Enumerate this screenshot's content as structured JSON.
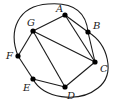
{
  "diagram": {
    "type": "graph",
    "nodes": [
      {
        "id": "A",
        "label": "A",
        "x": 65,
        "y": 15,
        "lx": 56,
        "ly": 12
      },
      {
        "id": "B",
        "label": "B",
        "x": 88,
        "y": 32,
        "lx": 93,
        "ly": 29
      },
      {
        "id": "C",
        "label": "C",
        "x": 95,
        "y": 62,
        "lx": 100,
        "ly": 72
      },
      {
        "id": "D",
        "label": "D",
        "x": 65,
        "y": 87,
        "lx": 67,
        "ly": 99
      },
      {
        "id": "E",
        "label": "E",
        "x": 33,
        "y": 79,
        "lx": 23,
        "ly": 91
      },
      {
        "id": "F",
        "label": "F",
        "x": 18,
        "y": 56,
        "lx": 6,
        "ly": 59
      },
      {
        "id": "G",
        "label": "G",
        "x": 33,
        "y": 31,
        "lx": 27,
        "ly": 26
      }
    ],
    "edges": [
      {
        "from": "G",
        "to": "A",
        "kind": "straight"
      },
      {
        "from": "G",
        "to": "C",
        "kind": "straight"
      },
      {
        "from": "G",
        "to": "D",
        "kind": "straight"
      },
      {
        "from": "G",
        "to": "F",
        "kind": "straight"
      },
      {
        "from": "A",
        "to": "B",
        "kind": "straight"
      },
      {
        "from": "A",
        "to": "C",
        "kind": "straight"
      },
      {
        "from": "B",
        "to": "C",
        "kind": "straight"
      },
      {
        "from": "C",
        "to": "D",
        "kind": "straight"
      },
      {
        "from": "D",
        "to": "E",
        "kind": "straight"
      },
      {
        "from": "E",
        "to": "F",
        "kind": "straight"
      },
      {
        "from": "F",
        "to": "B",
        "kind": "curve"
      },
      {
        "from": "E",
        "to": "B",
        "kind": "curve"
      }
    ]
  }
}
